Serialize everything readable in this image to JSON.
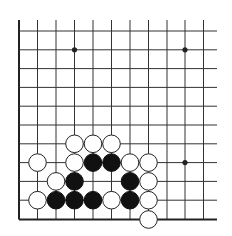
{
  "board": {
    "background": "#ffffff",
    "line_color": "#333333",
    "edge_color": "#222222",
    "black_stone_color": "#111111",
    "white_stone_color": "#ffffff",
    "white_stone_border": "#222222",
    "columns_x": [
      19,
      37.5,
      56,
      74.5,
      93,
      111.5,
      130,
      148.5,
      167,
      185,
      203.5
    ],
    "rows_y": [
      31,
      49.8,
      68.6,
      87.4,
      106.2,
      125,
      143.8,
      162.6,
      181.4,
      200.2,
      219.5
    ],
    "line_x_end": 217,
    "line_y_start": 20,
    "left_edge_visible": true,
    "bottom_edge_visible": true,
    "stone_radius": 8.8,
    "star_radius": 2.6,
    "star_points": [
      {
        "col": 3,
        "row": 1
      },
      {
        "col": 9,
        "row": 1
      },
      {
        "col": 9,
        "row": 7
      }
    ],
    "stones": [
      {
        "color": "white",
        "col": 3,
        "row": 6
      },
      {
        "color": "white",
        "col": 4,
        "row": 6
      },
      {
        "color": "white",
        "col": 5,
        "row": 6
      },
      {
        "color": "white",
        "col": 1,
        "row": 7
      },
      {
        "color": "white",
        "col": 3,
        "row": 7
      },
      {
        "color": "black",
        "col": 4,
        "row": 7
      },
      {
        "color": "black",
        "col": 5,
        "row": 7
      },
      {
        "color": "white",
        "col": 6,
        "row": 7
      },
      {
        "color": "white",
        "col": 7,
        "row": 7
      },
      {
        "color": "white",
        "col": 2,
        "row": 8
      },
      {
        "color": "black",
        "col": 3,
        "row": 8
      },
      {
        "color": "black",
        "col": 6,
        "row": 8
      },
      {
        "color": "white",
        "col": 7,
        "row": 8
      },
      {
        "color": "white",
        "col": 1,
        "row": 9
      },
      {
        "color": "black",
        "col": 2,
        "row": 9
      },
      {
        "color": "black",
        "col": 3,
        "row": 9
      },
      {
        "color": "black",
        "col": 4,
        "row": 9
      },
      {
        "color": "white",
        "col": 5,
        "row": 9
      },
      {
        "color": "black",
        "col": 6,
        "row": 9
      },
      {
        "color": "white",
        "col": 7,
        "row": 9
      },
      {
        "color": "white",
        "col": 7,
        "row": 10
      }
    ]
  }
}
